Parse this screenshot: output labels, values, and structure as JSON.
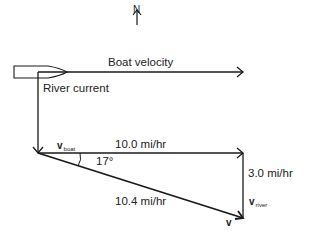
{
  "diagram": {
    "type": "vector-addition",
    "compass": {
      "label": "N"
    },
    "top_scene": {
      "boat_velocity_label": "Boat velocity",
      "river_current_label": "River current"
    },
    "triangle": {
      "v_boat": {
        "symbol": "v",
        "subscript": "boat",
        "magnitude": "10.0 mi/hr"
      },
      "v_river": {
        "symbol": "v",
        "subscript": "river",
        "magnitude": "3.0 mi/hr"
      },
      "v_result": {
        "symbol": "v",
        "magnitude": "10.4 mi/hr"
      },
      "angle": "17°"
    },
    "colors": {
      "ink": "#1a1a1a",
      "background": "#ffffff"
    }
  }
}
